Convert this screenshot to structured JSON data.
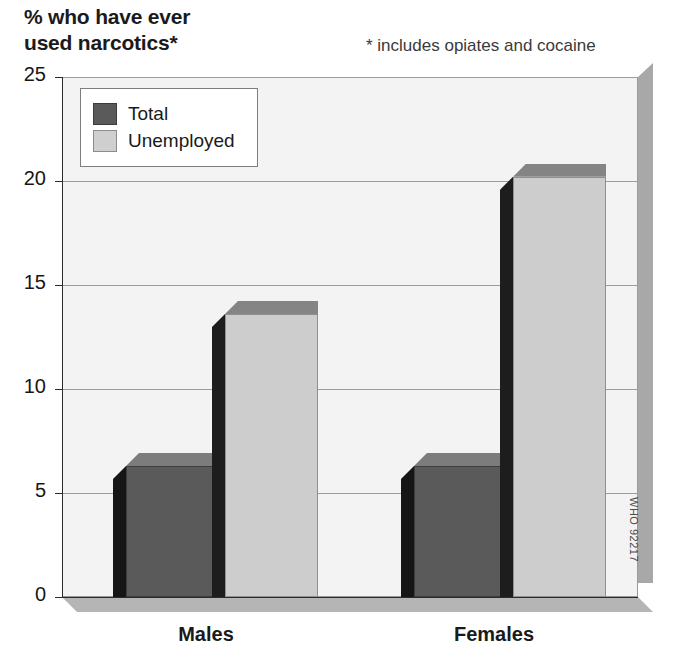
{
  "chart_data": {
    "type": "bar",
    "title": "% who have ever used narcotics*",
    "title_line1": "% who have ever",
    "title_line2": "used narcotics*",
    "footnote": "* includes opiates and cocaine",
    "xlabel": "",
    "ylabel": "% who have ever used narcotics*",
    "categories": [
      "Males",
      "Females"
    ],
    "series": [
      {
        "name": "Total",
        "values": [
          6.3,
          6.3
        ],
        "color": "#5a5a5a"
      },
      {
        "name": "Unemployed",
        "values": [
          13.6,
          20.2
        ],
        "color": "#cdcdcd"
      }
    ],
    "ylim": [
      0,
      25
    ],
    "yticks": [
      0,
      5,
      10,
      15,
      20,
      25
    ],
    "ytick_labels": [
      "0",
      "5",
      "10",
      "15",
      "20",
      "25"
    ],
    "grid": true,
    "legend_position": "top-left",
    "style": "3d-bar",
    "credit": "WHO 92217"
  },
  "legend": {
    "items": [
      {
        "label": "Total",
        "swatch": "dark"
      },
      {
        "label": "Unemployed",
        "swatch": "light"
      }
    ]
  }
}
